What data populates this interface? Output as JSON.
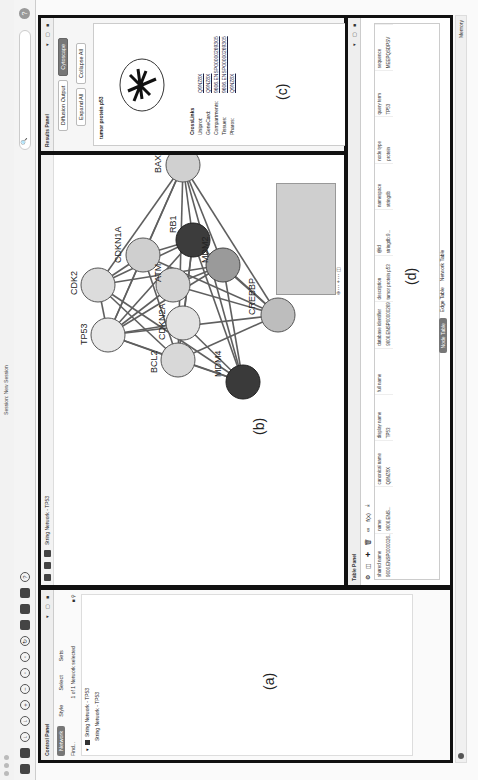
{
  "window": {
    "title": "Session: New Session"
  },
  "toolbar": {
    "search_placeholder": "",
    "help": "?"
  },
  "control_panel": {
    "title": "Control Panel",
    "tabs": [
      "Network",
      "Style",
      "Select",
      "Sets"
    ],
    "active_tab": "Network",
    "search_label": "Find...",
    "count": "1 of 1 Network selected",
    "networks": [
      {
        "label": "String Network - TP53",
        "checked": true
      },
      {
        "label": "String Network - TP53",
        "checked": false
      }
    ]
  },
  "network_view": {
    "tab_label": "String Network - TP53",
    "letter": "(b)",
    "nodes": [
      {
        "id": "TP53",
        "x": 250,
        "y": 55,
        "shade": "#e8e8e8"
      },
      {
        "id": "BCL2",
        "x": 225,
        "y": 125,
        "shade": "#d8d8d8"
      },
      {
        "id": "MDM4",
        "x": 203,
        "y": 190,
        "shade": "#3a3a3a"
      },
      {
        "id": "CDK2",
        "x": 300,
        "y": 45,
        "shade": "#dcdcdc"
      },
      {
        "id": "CDKN1A",
        "x": 330,
        "y": 90,
        "shade": "#cfcfcf"
      },
      {
        "id": "CDKN2A",
        "x": 262,
        "y": 130,
        "shade": "#e2e2e2"
      },
      {
        "id": "ATM",
        "x": 300,
        "y": 120,
        "shade": "#d4d4d4"
      },
      {
        "id": "RB1",
        "x": 345,
        "y": 140,
        "shade": "#3c3c3c"
      },
      {
        "id": "MDM2",
        "x": 320,
        "y": 170,
        "shade": "#9a9a9a"
      },
      {
        "id": "CREBBP",
        "x": 270,
        "y": 225,
        "shade": "#bdbdbd"
      },
      {
        "id": "BAX",
        "x": 420,
        "y": 130,
        "shade": "#d0d0d0"
      }
    ]
  },
  "results_panel": {
    "title": "Results Panel",
    "tabs": [
      "Diffusion Output",
      "Cytoscape"
    ],
    "buttons": [
      "Expand All",
      "Collapse All"
    ],
    "protein_name": "tumor protein p53",
    "letter": "(c)",
    "crosslinks": {
      "title": "CrossLinks",
      "rows": [
        {
          "key": "Uniprot:",
          "value": "Q9NZ8X"
        },
        {
          "key": "GeneCard:",
          "value": "Q9NZ8X"
        },
        {
          "key": "Compartments:",
          "value": "9606.ENSP00000269305"
        },
        {
          "key": "Tissues:",
          "value": "9606.ENSP00000269305"
        },
        {
          "key": "Pharos:",
          "value": "Q9NZ8X"
        }
      ]
    }
  },
  "table_panel": {
    "title": "Table Panel",
    "letter": "(d)",
    "columns": [
      "shared name",
      "name",
      "canonical name",
      "display name",
      "full name",
      "database identifier",
      "description",
      "@id",
      "namespace",
      "node type",
      "query term",
      "sequence"
    ],
    "rows": [
      [
        "9606.ENSP0000026...",
        "9606.ENS...",
        "Q9NZ8X",
        "TP53",
        "",
        "9606.ENSP00000269305",
        "tumor protein p53",
        "stringdb:9...",
        "stringdb",
        "protein",
        "TP53",
        "MEEPQSDPSV"
      ]
    ],
    "bottom_tabs": [
      "Node Table",
      "Edge Table",
      "Network Table"
    ],
    "active_bottom_tab": "Node Table"
  },
  "control_letter": "(a)",
  "status": {
    "memory": "Memory"
  }
}
